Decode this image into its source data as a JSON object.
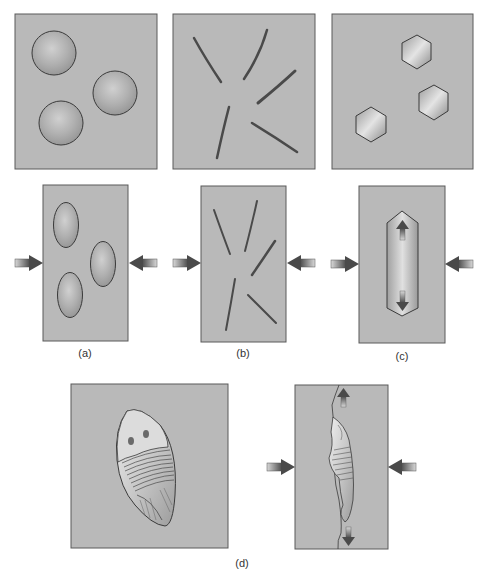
{
  "figure": {
    "panels": [
      {
        "id": "a",
        "label": "(a)",
        "before": "spheres",
        "after": "flattened ellipsoids"
      },
      {
        "id": "b",
        "label": "(b)",
        "before": "randomly oriented elongate grains",
        "after": "unchanged orientation under compression"
      },
      {
        "id": "c",
        "label": "(c)",
        "before": "hexagonal crystals",
        "after": "elongated crystal with extension arrows"
      },
      {
        "id": "d",
        "label": "(d)",
        "before": "undeformed trilobite fossil",
        "after": "deformed trilobite fossil with extension arrows"
      }
    ],
    "arrows": {
      "compression": "arrows pointing inward from left and right",
      "extension": "arrows pointing up and down"
    },
    "colors": {
      "panel_fill": "#b9b9b9",
      "panel_border": "#5a5a5a",
      "arrow_dark": "#4a4a4a",
      "arrow_light": "#d4d4d4",
      "background": "#ffffff"
    }
  }
}
